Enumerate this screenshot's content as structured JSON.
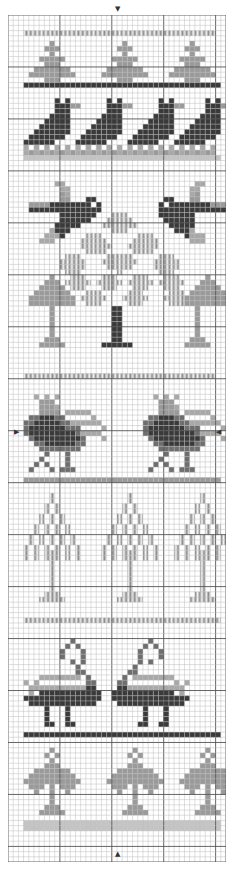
{
  "chart": {
    "title": "",
    "cols": 42,
    "rows": 163,
    "cell_px": 5.2,
    "major_every": 10,
    "colors": {
      "background": "#ffffff",
      "grid_minor": "#b8b8b8",
      "grid_major": "#555555",
      "D": "#3a3a3a",
      "M": "#6e6e6e",
      "L": "#9a9a9a",
      "P": "#c4c4c4",
      "V": "#8a8a8a",
      "X": "#a8a8a8"
    },
    "legend": {
      "D": "dark solid",
      "M": "medium solid",
      "L": "light solid",
      "P": "pale solid",
      "V": "vertical-stripe fill",
      "X": "light cross fill"
    },
    "markers": {
      "top": "▼",
      "bottom": "▲",
      "left": "▶",
      "right": "◀"
    },
    "motifs": [
      {
        "name": "striped-border-top",
        "row": 3
      },
      {
        "name": "small-trees-row",
        "row": 5
      },
      {
        "name": "dark-border",
        "row": 13
      },
      {
        "name": "crows-row",
        "row": 16
      },
      {
        "name": "flying-birds",
        "row": 32
      },
      {
        "name": "diamond-tree",
        "row": 42
      },
      {
        "name": "small-trees-pair",
        "row": 50
      },
      {
        "name": "striped-border-mid",
        "row": 69
      },
      {
        "name": "roosters-pair",
        "row": 73
      },
      {
        "name": "light-border",
        "row": 89
      },
      {
        "name": "tall-trees-row",
        "row": 92
      },
      {
        "name": "striped-border-lower",
        "row": 118
      },
      {
        "name": "swans-pair",
        "row": 122
      },
      {
        "name": "dark-border-lower",
        "row": 142
      },
      {
        "name": "leafy-trees-row",
        "row": 145
      },
      {
        "name": "pale-border-bottom",
        "row": 158
      }
    ],
    "pattern": [
      "..........................................",
      "..........................................",
      "..........................................",
      "...VVVVVVVVVVVVVVVVVVVVVVVVVVVVVVVVVVVVV..",
      "..........................................",
      "........L.............L............L......",
      ".......LLL...........LLL..........LLL.....",
      "........L.............L............L......",
      "......LLLLL.........LLLLL........LLLLL....",
      ".......LLL...........LLL..........LLL.....",
      ".....LLLLLLL.......LLLLLLL......LLLLLLL...",
      "....LLLLLLLLL.....LLLLLLLLL....LLLLLLLLL..",
      ".......LLL...........LLL..........LLL.....",
      "...DDDDDDDDDDDDDDDDDDDDDDDDDDDDDDDDDDDDDD..",
      "..........................................",
      "..........................................",
      ".........D.D.......D.D.......D.D......D.D.",
      ".........DDDLL.....DDDLL.....DDDLL....DDDLL",
      ".........DDD.......DDD.......DDD......DDD.",
      "........DDDD......DDDD......DDDD.....DDDD.",
      ".......DDDDD.....DDDDD.....DDDDD....DDDDD.",
      "......DDDDDD....DDDDDD....DDDDDD...DDDDDD.",
      ".....DDDDDDD...DDDDDDD...DDDDDDD..DDDDDDD.",
      "....DDDDDDD...DDDDDDD...DDDDDDD..DDDDDDD..",
      "...DDDDDD....DDDDDD....DDDDDD...DDDDDD....",
      "...X.X.X.X.X.X.X.X.X.X.X.X.X.X.X.X.X.X.X..",
      "...XLXLXLXLXLXLXLXLXLXLXLXLXLXLXLXLXLXLX..",
      "...PPPPPPPPPPPPPPPPPPPPPPPPPPPPPPPPPPPPPP..",
      "..........................................",
      "..........................................",
      "..........................................",
      "..........................................",
      ".........XX.........................XX.....",
      "..........XX.......................XX......",
      "..........LX.......................XL......",
      "..........LL...DD.............DD...LL......",
      "....LLLLDDDDDDDD.D...........D.DDDDDDDDLLLL",
      "....DDDDDDDDDDDDDD...........DDDDDDDDDDDDDD",
      "..........DDDDDDD...VVV......DDDDDDD.......",
      "..........DDDDDD...VVVVV......DDDDDD.......",
      ".........DDDDD....VVVVVVV......DDDDD.......",
      "........XDDD........VVV.........DDDX.......",
      ".......XXXD....VVV.......VVV......DXXX.....",
      "......XXX.....VVVVV.....VVVVV......XXX.....",
      "..............VVVVVV...VVVVVV.............",
      "...............VVVV.....VVVV..............",
      "...........VVV.....VVVVV.....VVV..........",
      "..........VVVVV...VVVVVVV...VVVVV.........",
      "..........VVVVV....VVVVV....VVVVV.........",
      "...........VVV.......V.......VVV..........",
      "........L...VVV...VVV...VVV...VVV.....L...",
      ".......LLL.VVVVV.VVVVV.VVVVV.VVVVV...LLL..",
      "......LLLLL.VVV...VVV...VVV...VVV...LLLLL.",
      ".....LLLLLLL...VVV.....VVV.....VVV.LLLLLLL",
      "....LLLLLLLLL.VVVVV...VVVVV...VVVVLLLLLLLLL",
      "....LLLLLLLLL..VVV.....VVV.....VVVLLLLLLLLL",
      "........L...........DD..............L......",
      "........L...........DD..............L......",
      "........L...........DD..............L......",
      "........L...........DD..............L......",
      "........L...........DD..............L......",
      "........L...........DD..............L......",
      ".......LLL..........DD.............LLL.....",
      "......LLLLL.......DDDDDD..........LLLLL....",
      "..........................................",
      "..........................................",
      "..........................................",
      "..........................................",
      "..........................................",
      "...VVVVVVVVVVVVVVVVVVVVVVVVVVVVVVVVVVVVV..",
      "..........................................",
      "..........................................",
      "..........................................",
      ".....X.X.X..................X.X.X..........",
      "......LLL....................LLL...........",
      "......LLLX...................LLLX..........",
      "......LLLL.XXXXX.............LLLL.XXXXX....",
      "....MMDDDMM.....X..........MMDDDMM.....X...",
      "...MMDDDDDMMXXXXXX........MMDDDDDMMXXXXXX..",
      "...MDDDDDDDMMM....X.......MDDDDDDDMMM....X.",
      "...MDDDDDDDDDMXXXX........MDDDDDDDDDMXXXX..",
      "....MDDDDDDDDDM...X........MDDDDDDDDDM...X.",
      ".....MMDDDDDDMM.............MMDDDDDDMM.....",
      "......MMMMMMMM...............MMMMMMMM......",
      ".......M...M..................M...M.......",
      "......M....M.................M....M........",
      ".....M.M...M................M.M...M........",
      "....M...M.MMM..............M...M.MMM.......",
      "..........................................",
      "...LLLLLLLLLLLLLLLLLLLLLLLLLLLLLLLLLLLLLL..",
      "..........................................",
      "..........................................",
      "........V..............V.............V.....",
      "........V..............V.............V.....",
      ".......V.V............V.V...........V.V....",
      ".......V.V............V.V...........V.V....",
      "......V.V.V..........V.V.V.........V.V.V...",
      "......V.V.V..........V.V.V.........V.V.V...",
      ".....V.V.V.V........V.V.V.V.......V.V.V.V..",
      ".....V.V.V.V........V.V.V.V.......V.V.V.V..",
      "....V.V.V.V.V......V.V.V.V.V.....V.V.V.V.V.",
      "....V.V.V.V.V......V.V.V.V.V.....V.V.V.V.V.",
      "...V.V.V.V.V.V....V.V.V.V.V.V...V.V.V.V.V.V",
      "...V.V.VVV.V.V....V.V.VVV.V.V...V.V.VVV.V.V",
      "...V.V.VVV.V.V....V.V.VVV.V.V...V.V.VVV.V.V",
      "........V..............V.............V.....",
      "........V..............V.............V.....",
      "........V..............V.............V.....",
      "........V..............V.............V.....",
      "........V..............V.............V.....",
      "........V..............V.............V.....",
      ".......VVV............VVV...........VVV....",
      "......VVVVV..........VVVVV.........VVVVV...",
      "..........................................",
      "..........................................",
      "..........................................",
      "...VVVVVVVVVVVVVVVVVVVVVVVVVVVVVVVVVVVVVV..",
      "..........................................",
      "..........................................",
      "..........................................",
      "............M..............M...............",
      "...........M.M............M.M..............",
      "..........M...M..........M...M.............",
      "..........M...M..........M...M.............",
      "............M.M..........M.M...............",
      ".............M..........M..................",
      ".............MM........MM..................",
      "......XXXXXXXX.M......M.XXXXXXXX...........",
      "...X.X.........MM....MM.........X.X........",
      "....XXXXXXXXXXXDD....DDXXXXXXXXXXX.........",
      "....X.DDDDDDDDDDDD..DDDDDDDDDDDD.X.........",
      "...DDDDDDDDDDDDDDD..DDDDDDDDDDDDDDD........",
      "....DDDDDDDDDDDDD....DDDDDDDDDDDDD.........",
      ".......D...D..............D...D............",
      ".......D...D..............D...D............",
      ".......D...D..............D...D............",
      ".......DD..DD............DD..DD............",
      "..........................................",
      "...DDDDDDDDDDDDDDDDDDDDDDDDDDDDDDDDDDDDDD..",
      "..........................................",
      "..........................................",
      "........L...............L.............L....",
      ".......L.L.............L.L...........L.L...",
      "........L...............L.............L....",
      ".......LLL.............LLL...........LLL...",
      ".....LLLLLLL.........LLLLLLL.......LLLLLLL.",
      "....LLLLLLLLL.......LLLLLLLLL.....LLLLLLLLL",
      "...LLLLLLLLLLL.....LLLLLLLLLLL...LLLLLLLLLL",
      "....LLL.L.LLL.......LLL.L.LLL.....LLL.L.LLL",
      ".....L..L..L.........L..L..L.......L..L..L.",
      "........L...............L.............L....",
      "........L...............L.............L....",
      ".......LLL.............LLL...........LLL...",
      "......LLLLL...........LLLLL.........LLLLL..",
      "..........................................",
      "...PPPPPPPPPPPPPPPPPPPPPPPPPPPPPPPPPPPPPP..",
      "...PPPPPPPPPPPPPPPPPPPPPPPPPPPPPPPPPPPPPP..",
      "..........................................",
      "..........................................",
      "..........................................",
      ".........................................."
    ]
  }
}
